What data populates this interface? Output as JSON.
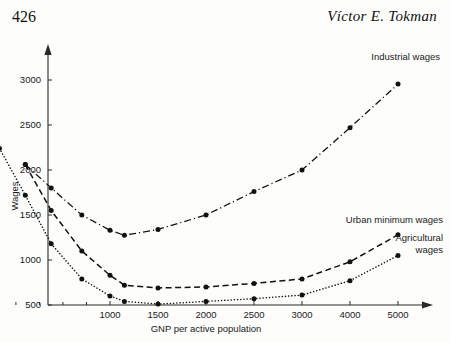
{
  "page": {
    "folio": "426",
    "running_head": "Víctor E. Tokman"
  },
  "chart_data": {
    "type": "line",
    "title": "",
    "xlabel": "GNP per active population",
    "ylabel": "Wages",
    "x_tick_labels": [
      "1000",
      "1500",
      "2000",
      "2500",
      "3000",
      "4000",
      "5000"
    ],
    "x_tick_values": [
      1000,
      1500,
      2000,
      2500,
      3000,
      4000,
      5000
    ],
    "y_tick_labels": [
      "500",
      "1000",
      "1500",
      "2000",
      "2500",
      "3000"
    ],
    "y_tick_values": [
      500,
      1000,
      1500,
      2000,
      2500,
      3000
    ],
    "xlim": [
      400,
      5400
    ],
    "ylim": [
      350,
      3150
    ],
    "grid": false,
    "legend_position": "inline-right",
    "axis_note": "x-axis is compressed/non-linear: equal pixel spacing between 1000-1500-2000-2500-3000-4000-5000, with minor unlabeled ticks below 1000",
    "series": [
      {
        "name": "Industrial wages",
        "style": "dash-dot",
        "marker": "filled-circle",
        "label_x": 5000,
        "label_y": 3080,
        "points": [
          {
            "x": 640,
            "y": 2060
          },
          {
            "x": 750,
            "y": 1800
          },
          {
            "x": 880,
            "y": 1500
          },
          {
            "x": 1000,
            "y": 1330
          },
          {
            "x": 1150,
            "y": 1275
          },
          {
            "x": 1500,
            "y": 1340
          },
          {
            "x": 2000,
            "y": 1500
          },
          {
            "x": 2500,
            "y": 1760
          },
          {
            "x": 3000,
            "y": 2000
          },
          {
            "x": 4000,
            "y": 2470
          },
          {
            "x": 5000,
            "y": 2955
          }
        ]
      },
      {
        "name": "Urban minimum wages",
        "style": "dashed",
        "marker": "filled-circle",
        "label_x": 5000,
        "label_y": 1390,
        "points": [
          {
            "x": 640,
            "y": 2060
          },
          {
            "x": 750,
            "y": 1550
          },
          {
            "x": 880,
            "y": 1100
          },
          {
            "x": 1000,
            "y": 830
          },
          {
            "x": 1150,
            "y": 720
          },
          {
            "x": 1500,
            "y": 690
          },
          {
            "x": 2000,
            "y": 700
          },
          {
            "x": 2500,
            "y": 740
          },
          {
            "x": 3000,
            "y": 790
          },
          {
            "x": 4000,
            "y": 980
          },
          {
            "x": 5000,
            "y": 1280
          }
        ]
      },
      {
        "name": "Agricultural wages",
        "style": "dotted",
        "marker": "filled-circle",
        "label_x": 5000,
        "label_y": 1190,
        "label_line_2": "wages",
        "points": [
          {
            "x": 530,
            "y": 2240
          },
          {
            "x": 640,
            "y": 1720
          },
          {
            "x": 750,
            "y": 1180
          },
          {
            "x": 880,
            "y": 790
          },
          {
            "x": 1000,
            "y": 600
          },
          {
            "x": 1150,
            "y": 540
          },
          {
            "x": 1500,
            "y": 510
          },
          {
            "x": 2000,
            "y": 540
          },
          {
            "x": 2500,
            "y": 570
          },
          {
            "x": 3000,
            "y": 610
          },
          {
            "x": 4000,
            "y": 770
          },
          {
            "x": 5000,
            "y": 1050
          }
        ]
      }
    ],
    "minor_x_ticks": [
      600,
      700,
      800,
      900
    ],
    "labels": {
      "industrial": "Industrial wages",
      "urban": "Urban minimum wages",
      "agricultural_line1": "Agricultural",
      "agricultural_line2": "wages"
    }
  }
}
